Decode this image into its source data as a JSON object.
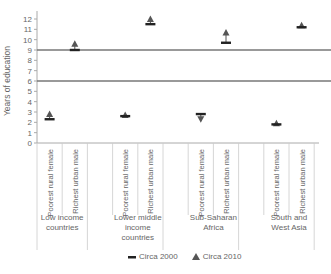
{
  "chart_data": {
    "type": "scatter",
    "title": "",
    "xlabel": "",
    "ylabel": "Years of education",
    "ylim": [
      0,
      12
    ],
    "yticks": [
      0,
      1,
      2,
      3,
      4,
      5,
      6,
      7,
      8,
      9,
      10,
      11,
      12
    ],
    "reference_lines": [
      9,
      6
    ],
    "groups": [
      {
        "label": "Low income countries",
        "label_lines": [
          "Low income",
          "countries"
        ]
      },
      {
        "label": "Lower middle income countries",
        "label_lines": [
          "Lower middle",
          "income",
          "countries"
        ]
      },
      {
        "label": "Sub-Saharan Africa",
        "label_lines": [
          "Sub-Saharan",
          "Africa"
        ]
      },
      {
        "label": "South and West Asia",
        "label_lines": [
          "South and",
          "West Asia"
        ]
      }
    ],
    "categories": [
      "Low income countries | Poorest rural female",
      "Low income countries | Richest urban male",
      "Lower middle income countries | Poorest rural female",
      "Lower middle income countries | Richest urban male",
      "Sub-Saharan Africa | Poorest rural female",
      "Sub-Saharan Africa | Richest urban male",
      "South and West Asia | Poorest rural female",
      "South and West Asia | Richest urban male"
    ],
    "subcategory_labels": [
      "Poorest rural female",
      "Richest urban male"
    ],
    "series": [
      {
        "name": "Circa 2000",
        "marker": "dash",
        "values": [
          2.3,
          9.0,
          2.6,
          11.5,
          2.8,
          9.7,
          1.8,
          11.2
        ]
      },
      {
        "name": "Circa 2010",
        "marker": "triangle",
        "values": [
          2.8,
          9.6,
          2.7,
          12.0,
          2.3,
          10.7,
          1.9,
          11.4
        ]
      }
    ],
    "legend_position": "bottom",
    "grid": false
  },
  "legend": {
    "items": [
      {
        "label": "Circa 2000"
      },
      {
        "label": "Circa 2010"
      }
    ]
  }
}
